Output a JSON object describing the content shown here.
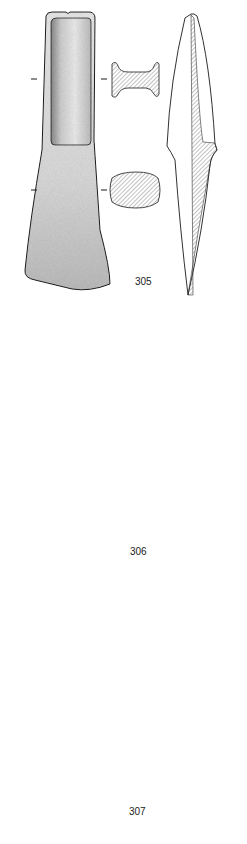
{
  "plate": {
    "title": "Bronze axes plate",
    "artifacts": [
      {
        "number": "305",
        "label_pos": {
          "x": 135,
          "y": 283
        }
      },
      {
        "number": "306",
        "label_pos": {
          "x": 130,
          "y": 553
        }
      },
      {
        "number": "307",
        "label_pos": {
          "x": 129,
          "y": 812
        }
      }
    ],
    "scale_bar": {
      "segments": 5,
      "x1": 95,
      "x2": 187,
      "y": 829
    }
  },
  "colors": {
    "ink": "#1a1a1a",
    "stipple_dark": "#3a3a3a",
    "hatch": "#555555",
    "background": "#ffffff"
  }
}
